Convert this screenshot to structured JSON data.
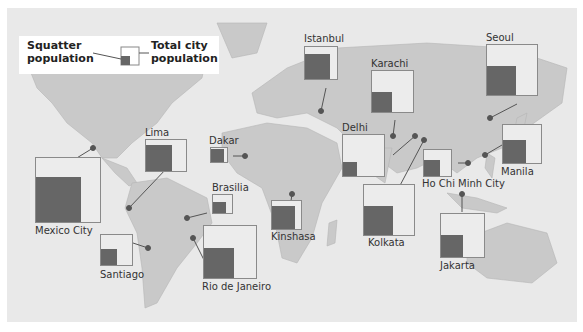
{
  "legend": {
    "squatter_label_line1": "Squatter",
    "squatter_label_line2": "population",
    "total_label_line1": "Total city",
    "total_label_line2": "population"
  },
  "colors": {
    "ocean": "#e9e9e9",
    "land": "#c9c9c9",
    "squatter": "#666666",
    "box_border": "#8a8a8a"
  },
  "cities": [
    {
      "name": "Mexico City"
    },
    {
      "name": "Lima"
    },
    {
      "name": "Santiago"
    },
    {
      "name": "Brasilia"
    },
    {
      "name": "Rio de Janeiro"
    },
    {
      "name": "Dakar"
    },
    {
      "name": "Kinshasa"
    },
    {
      "name": "Istanbul"
    },
    {
      "name": "Delhi"
    },
    {
      "name": "Karachi"
    },
    {
      "name": "Kolkata"
    },
    {
      "name": "Ho Chi Minh City"
    },
    {
      "name": "Jakarta"
    },
    {
      "name": "Manila"
    },
    {
      "name": "Seoul"
    }
  ]
}
